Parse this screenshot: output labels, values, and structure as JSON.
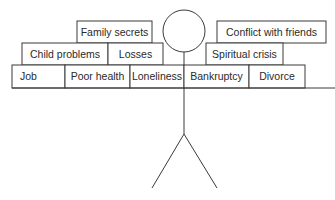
{
  "diagram": {
    "top_row": [
      {
        "label": "Family secrets"
      },
      {
        "label": "Conflict with friends"
      }
    ],
    "middle_row": [
      {
        "label": "Child problems"
      },
      {
        "label": "Losses"
      },
      {
        "label": "Spiritual crisis"
      }
    ],
    "bottom_row": [
      {
        "label": "Job"
      },
      {
        "label": "Poor health"
      },
      {
        "label": "Loneliness"
      },
      {
        "label": "Bankruptcy"
      },
      {
        "label": "Divorce"
      }
    ],
    "colors": {
      "stroke": "#3a3a3a",
      "text": "#2a2a2a",
      "background": "#ffffff"
    }
  }
}
